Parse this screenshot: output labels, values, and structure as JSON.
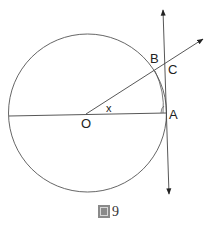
{
  "figure": {
    "caption_prefix": "圖",
    "caption_number": "9",
    "caption": "圖9"
  },
  "diagram": {
    "type": "circle-tangent-geometry",
    "circle": {
      "center": [
        87.5,
        113
      ],
      "radius": 79
    },
    "points": {
      "O": {
        "label": "O",
        "x": 87,
        "y": 114
      },
      "A": {
        "label": "A",
        "x": 166,
        "y": 113
      },
      "B": {
        "label": "B",
        "x": 155,
        "y": 71
      },
      "C": {
        "label": "C",
        "x": 165,
        "y": 65
      }
    },
    "angle_label": "x",
    "segments": [
      {
        "name": "diameter",
        "from": "left-edge",
        "to": "A"
      },
      {
        "name": "ray-OC",
        "from": "O",
        "to": "arrow-upper-right"
      },
      {
        "name": "tangent-at-A",
        "from": "arrow-top",
        "to": "arrow-bottom"
      }
    ],
    "colors": {
      "stroke": "#444444",
      "text": "#222222"
    }
  }
}
